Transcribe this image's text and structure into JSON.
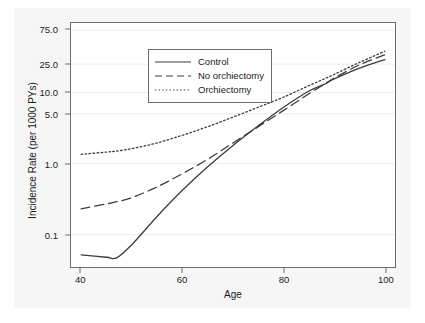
{
  "chart_data": {
    "type": "line",
    "title": "",
    "xlabel": "Age",
    "ylabel": "Incidence Rate (per 1000 PYs)",
    "xlim": [
      38,
      102
    ],
    "ylim": [
      0.035,
      95
    ],
    "yscale": "log",
    "grid": "horizontal-faint",
    "legend_position": "top-left-inside",
    "xticks": [
      40,
      60,
      80,
      100
    ],
    "xtick_labels": [
      "40",
      "60",
      "80",
      "100"
    ],
    "yticks": [
      0.1,
      1.0,
      5.0,
      10.0,
      25.0,
      75.0
    ],
    "ytick_labels": [
      "0.1",
      "1.0",
      "5.0",
      "10.0",
      "25.0",
      "75.0"
    ],
    "x": [
      40,
      45,
      47,
      50,
      55,
      60,
      65,
      70,
      75,
      80,
      85,
      88,
      90,
      95,
      100
    ],
    "series": [
      {
        "name": "Control",
        "style": "solid",
        "color": "#3c3c3c",
        "values": [
          0.052,
          0.048,
          0.047,
          0.072,
          0.18,
          0.42,
          0.9,
          1.8,
          3.4,
          6.2,
          10.5,
          13.0,
          15.5,
          22.0,
          29.0
        ]
      },
      {
        "name": "No orchiectomy",
        "style": "dashed",
        "color": "#3c3c3c",
        "values": [
          0.23,
          0.27,
          0.29,
          0.33,
          0.47,
          0.72,
          1.15,
          1.95,
          3.3,
          5.6,
          9.6,
          13.0,
          16.0,
          24.5,
          34.0
        ]
      },
      {
        "name": "Orchiectomy",
        "style": "dotted",
        "color": "#3c3c3c",
        "values": [
          1.35,
          1.45,
          1.5,
          1.62,
          1.95,
          2.5,
          3.3,
          4.5,
          6.2,
          8.6,
          12.5,
          15.5,
          18.0,
          26.5,
          38.0
        ]
      }
    ]
  },
  "legend": {
    "items": [
      {
        "label": "Control"
      },
      {
        "label": "No orchiectomy"
      },
      {
        "label": "Orchiectomy"
      }
    ]
  }
}
